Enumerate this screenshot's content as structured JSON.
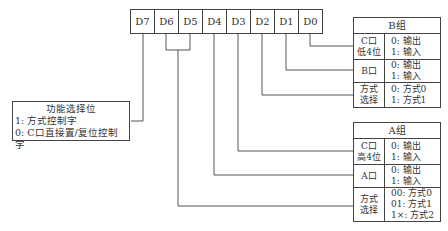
{
  "bits": [
    "D7",
    "D6",
    "D5",
    "D4",
    "D3",
    "D2",
    "D1",
    "D0"
  ],
  "function_box": {
    "title": "功能选择位",
    "lines": [
      "1: 方式控制字",
      "0: C口直接置/复位控制字"
    ]
  },
  "group_b": {
    "title": "B组",
    "rows": [
      {
        "label": [
          "C口",
          "低4位"
        ],
        "values": [
          "0: 输出",
          "1: 输入"
        ]
      },
      {
        "label": [
          "B口"
        ],
        "values": [
          "0: 输出",
          "1: 输入"
        ]
      },
      {
        "label": [
          "方式",
          "选择"
        ],
        "values": [
          "0: 方式0",
          "1: 方式1"
        ]
      }
    ]
  },
  "group_a": {
    "title": "A组",
    "rows": [
      {
        "label": [
          "C口",
          "高4位"
        ],
        "values": [
          "0: 输出",
          "1: 输入"
        ]
      },
      {
        "label": [
          "A口"
        ],
        "values": [
          "0: 输出",
          "1: 输入"
        ]
      },
      {
        "label": [
          "方式",
          "选择"
        ],
        "values": [
          "00: 方式0",
          "01: 方式1",
          "1×: 方式2"
        ]
      }
    ]
  }
}
